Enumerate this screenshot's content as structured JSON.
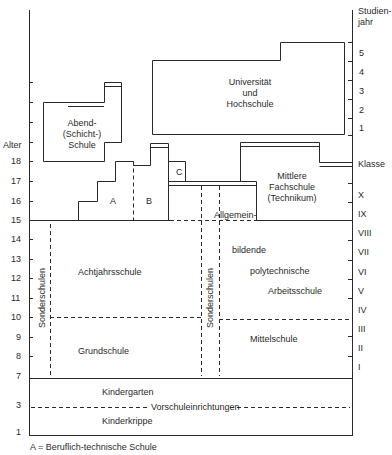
{
  "axes": {
    "left_title": "Alter",
    "right_title_line1": "Studien-",
    "right_title_line2": "jahr",
    "right_klasse": "Klasse",
    "age_ticks": [
      "18",
      "17",
      "16",
      "15",
      "14",
      "13",
      "12",
      "11",
      "10",
      "9",
      "8",
      "7",
      "3",
      "1"
    ],
    "studienjahr_ticks": [
      "5",
      "4",
      "3",
      "2",
      "1"
    ],
    "klasse_ticks": [
      "X",
      "IX",
      "VIII",
      "VII",
      "VI",
      "V",
      "IV",
      "III",
      "II",
      "I"
    ]
  },
  "blocks": {
    "abend": [
      "Abend-",
      "(Schicht-)",
      "Schule"
    ],
    "universitaet": [
      "Universität",
      "und",
      "Hochschule"
    ],
    "fachschule": [
      "Mittlere",
      "Fachschule",
      "(Technikum)"
    ],
    "a": "A",
    "b": "B",
    "c": "C",
    "allgemein": "Allgemein-",
    "bildende": "bildende",
    "polytechnische": "polytechnische",
    "arbeitsschule": "Arbeitsschule",
    "achtjahrsschule": "Achtjahrsschule",
    "grundschule": "Grundschule",
    "mittelschule": "Mittelschule",
    "sonderschulen_left": "Sonderschulen",
    "sonderschulen_mid": "Sonderschulen",
    "kindergarten": "Kindergarten",
    "vorschule": "Vorschuleinrichtungen",
    "kinderkrippe": "Kinderkrippe"
  },
  "legend": {
    "a_note": "A = Beruflich-technische Schule"
  }
}
